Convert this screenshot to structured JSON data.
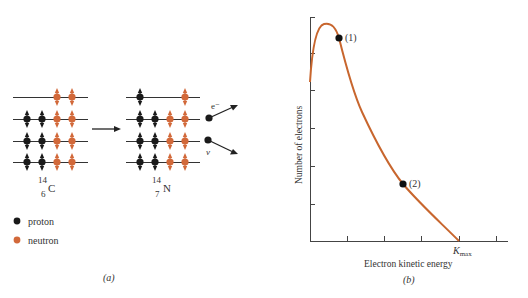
{
  "panel_a": {
    "caption": "(a)",
    "parent": {
      "mass": "14",
      "atomic": "6",
      "symbol": "C"
    },
    "daughter": {
      "mass": "14",
      "atomic": "7",
      "symbol": "N"
    },
    "electron_label": "e⁻",
    "neutrino_label": "ν",
    "legend": [
      {
        "label": "proton",
        "color": "#1a1a1a"
      },
      {
        "label": "neutron",
        "color": "#d2693a"
      }
    ],
    "parent_levels": [
      [
        "",
        "",
        "n",
        "n"
      ],
      [
        "p",
        "p",
        "n",
        "n"
      ],
      [
        "p",
        "p",
        "n",
        "n"
      ],
      [
        "p",
        "p",
        "n",
        "n"
      ]
    ],
    "daughter_levels": [
      [
        "p",
        "",
        "",
        "n"
      ],
      [
        "p",
        "p",
        "n",
        "n"
      ],
      [
        "p",
        "p",
        "n",
        "n"
      ],
      [
        "p",
        "p",
        "n",
        "n"
      ]
    ]
  },
  "panel_b": {
    "caption": "(b)",
    "ylabel": "Number of electrons",
    "xlabel": "Electron kinetic energy",
    "kmax_label": "K",
    "kmax_sub": "max",
    "point1_label": "(1)",
    "point2_label": "(2)"
  },
  "chart_data": {
    "type": "line",
    "title": "",
    "xlabel": "Electron kinetic energy",
    "ylabel": "Number of electrons",
    "x": [
      0,
      0.05,
      0.1,
      0.15,
      0.2,
      0.25,
      0.3,
      0.4,
      0.5,
      0.6,
      0.7,
      0.8,
      0.9,
      1.0
    ],
    "values": [
      0.71,
      0.92,
      0.97,
      0.96,
      0.88,
      0.79,
      0.7,
      0.55,
      0.42,
      0.31,
      0.22,
      0.13,
      0.06,
      0.0
    ],
    "annotations": [
      {
        "label": "(1)",
        "x": 0.2,
        "y": 0.91
      },
      {
        "label": "(2)",
        "x": 0.62,
        "y": 0.25
      },
      {
        "label": "Kmax",
        "x": 1.0,
        "y": 0.0
      }
    ],
    "xlim": [
      0,
      1.33
    ],
    "ylim": [
      0,
      1.0
    ],
    "curve_color": "#c8662e",
    "grid": false
  }
}
